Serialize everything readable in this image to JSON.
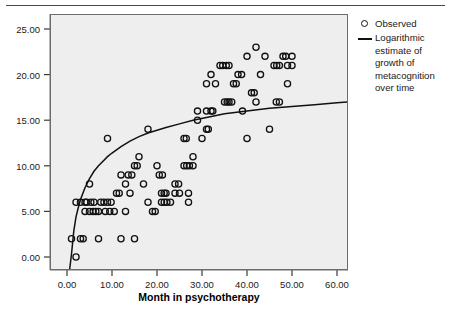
{
  "figure": {
    "background_color": "#ffffff",
    "plot_background_color": "#eeeeee",
    "frame_color": "#6d6d6d",
    "marker_color": "#111111",
    "line_color": "#111111"
  },
  "axis": {
    "x_title": "Month in psychotherapy",
    "x_ticks": [
      "0.00",
      "10.00",
      "20.00",
      "30.00",
      "40.00",
      "50.00",
      "60.00"
    ],
    "y_ticks": [
      "0.00",
      "5.00",
      "10.00",
      "15.00",
      "20.00",
      "25.00"
    ]
  },
  "legend": {
    "items": [
      {
        "key": "circle-marker",
        "label": "Observed"
      },
      {
        "key": "line-marker",
        "label": "Logarithmic estimate of growth of metacognition over time"
      }
    ]
  },
  "chart_data": {
    "type": "scatter",
    "title": "",
    "xlabel": "Month in psychotherapy",
    "ylabel": "",
    "xlim": [
      -3,
      63
    ],
    "ylim": [
      -2,
      27
    ],
    "grid": false,
    "legend_position": "right",
    "series": [
      {
        "name": "Observed",
        "type": "scatter",
        "marker": "open-circle",
        "points": [
          [
            1,
            2
          ],
          [
            2,
            0
          ],
          [
            2,
            6
          ],
          [
            3,
            2
          ],
          [
            3.6,
            2
          ],
          [
            3,
            6
          ],
          [
            4,
            6
          ],
          [
            4.4,
            6
          ],
          [
            4,
            5
          ],
          [
            5,
            5
          ],
          [
            5,
            8
          ],
          [
            5.3,
            6
          ],
          [
            6,
            6
          ],
          [
            5.8,
            5
          ],
          [
            6.4,
            5
          ],
          [
            7,
            5
          ],
          [
            7,
            2
          ],
          [
            7.5,
            6
          ],
          [
            8.2,
            6
          ],
          [
            9,
            6
          ],
          [
            9,
            13
          ],
          [
            9.8,
            6
          ],
          [
            8.5,
            5
          ],
          [
            9.5,
            5
          ],
          [
            10.5,
            5
          ],
          [
            11,
            7
          ],
          [
            11.6,
            7
          ],
          [
            12,
            2
          ],
          [
            12,
            9
          ],
          [
            13,
            8
          ],
          [
            13,
            5
          ],
          [
            14,
            7
          ],
          [
            13.6,
            9
          ],
          [
            14.4,
            9
          ],
          [
            15,
            2
          ],
          [
            15,
            10
          ],
          [
            15.6,
            10
          ],
          [
            16,
            11
          ],
          [
            17,
            8
          ],
          [
            18,
            14
          ],
          [
            18,
            6
          ],
          [
            19,
            5
          ],
          [
            19.6,
            5
          ],
          [
            20,
            10
          ],
          [
            20.5,
            9
          ],
          [
            21.2,
            9
          ],
          [
            21,
            7
          ],
          [
            21.6,
            7
          ],
          [
            22,
            7
          ],
          [
            21,
            6
          ],
          [
            21.6,
            6
          ],
          [
            22.2,
            6
          ],
          [
            23,
            6
          ],
          [
            24,
            8
          ],
          [
            24.8,
            8
          ],
          [
            24,
            7
          ],
          [
            25,
            7
          ],
          [
            26,
            13
          ],
          [
            26.5,
            13
          ],
          [
            26,
            10
          ],
          [
            26.6,
            10
          ],
          [
            27.2,
            10
          ],
          [
            27,
            7
          ],
          [
            27,
            6
          ],
          [
            28,
            11
          ],
          [
            28,
            10
          ],
          [
            29,
            15
          ],
          [
            29,
            16
          ],
          [
            30,
            13
          ],
          [
            31,
            14
          ],
          [
            31.4,
            14
          ],
          [
            31,
            16
          ],
          [
            32,
            16
          ],
          [
            32.4,
            16
          ],
          [
            31,
            19
          ],
          [
            32,
            20
          ],
          [
            33,
            19
          ],
          [
            34,
            21
          ],
          [
            35,
            17
          ],
          [
            35.6,
            17
          ],
          [
            36,
            17
          ],
          [
            36.6,
            17
          ],
          [
            34.6,
            21
          ],
          [
            35.4,
            21
          ],
          [
            36,
            21
          ],
          [
            37,
            19
          ],
          [
            37.6,
            19
          ],
          [
            38,
            20
          ],
          [
            38.8,
            20
          ],
          [
            39,
            16
          ],
          [
            40,
            13
          ],
          [
            40,
            22
          ],
          [
            41,
            18
          ],
          [
            41.6,
            18
          ],
          [
            42,
            23
          ],
          [
            42,
            17
          ],
          [
            43,
            20
          ],
          [
            44,
            22
          ],
          [
            45,
            14
          ],
          [
            46,
            21
          ],
          [
            46.6,
            21
          ],
          [
            47.2,
            21
          ],
          [
            46.5,
            17
          ],
          [
            47.2,
            17
          ],
          [
            48,
            22
          ],
          [
            48.6,
            22
          ],
          [
            49,
            21
          ],
          [
            49,
            19
          ],
          [
            50,
            22
          ],
          [
            50,
            21
          ]
        ]
      },
      {
        "name": "Logarithmic estimate of growth of metacognition over time",
        "type": "line",
        "curve": "logarithmic",
        "formula_points": [
          [
            0.55,
            -1.5
          ],
          [
            1,
            0.3
          ],
          [
            1.5,
            2.8
          ],
          [
            2,
            4.4
          ],
          [
            2.5,
            5.4
          ],
          [
            3,
            6.3
          ],
          [
            4,
            7.6
          ],
          [
            5,
            8.6
          ],
          [
            6,
            9.4
          ],
          [
            7,
            10.0
          ],
          [
            8,
            10.5
          ],
          [
            9,
            11.0
          ],
          [
            10,
            11.4
          ],
          [
            12,
            12.1
          ],
          [
            14,
            12.7
          ],
          [
            16,
            13.2
          ],
          [
            18,
            13.6
          ],
          [
            20,
            13.9
          ],
          [
            22,
            14.2
          ],
          [
            25,
            14.6
          ],
          [
            28,
            15.0
          ],
          [
            31,
            15.3
          ],
          [
            35,
            15.7
          ],
          [
            40,
            16.0
          ],
          [
            45,
            16.3
          ],
          [
            50,
            16.5
          ],
          [
            55,
            16.7
          ],
          [
            60,
            16.9
          ],
          [
            62.5,
            17.0
          ]
        ]
      }
    ]
  }
}
